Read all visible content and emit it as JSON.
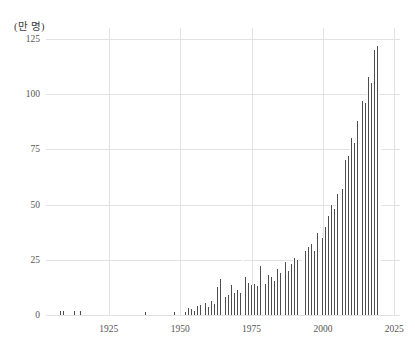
{
  "chart_data": {
    "type": "bar",
    "title": "",
    "subtitle": "",
    "xlabel": "",
    "ylabel": "(만 명)",
    "ylabel_note": "unit: 10,000 persons",
    "xlim": [
      1903,
      2027
    ],
    "ylim": [
      0,
      130
    ],
    "grid": true,
    "legend": null,
    "y_ticks": [
      0,
      25,
      50,
      75,
      100,
      125
    ],
    "x_ticks": [
      1925,
      1950,
      1975,
      2000,
      2025
    ],
    "bar_color": "#4d4d4d",
    "grid_color": "#e2e2e2",
    "tick_color": "#555555",
    "categories": [
      1908,
      1909,
      1913,
      1915,
      1938,
      1948,
      1952,
      1953,
      1954,
      1955,
      1956,
      1957,
      1958,
      1959,
      1960,
      1961,
      1962,
      1963,
      1964,
      1965,
      1966,
      1967,
      1968,
      1969,
      1970,
      1971,
      1972,
      1973,
      1974,
      1975,
      1976,
      1977,
      1978,
      1979,
      1980,
      1981,
      1982,
      1983,
      1984,
      1985,
      1986,
      1987,
      1988,
      1989,
      1990,
      1991,
      1992,
      1993,
      1994,
      1995,
      1996,
      1997,
      1998,
      1999,
      2000,
      2001,
      2002,
      2003,
      2004,
      2005,
      2006,
      2007,
      2008,
      2009,
      2010,
      2011,
      2012,
      2013,
      2014,
      2015,
      2016,
      2017,
      2018,
      2019,
      2020
    ],
    "values": [
      2.0,
      2.0,
      2.0,
      2.0,
      1.5,
      1.5,
      1.5,
      3.0,
      2.5,
      2.0,
      4.0,
      4.5,
      4.5,
      5.5,
      3.5,
      6.5,
      5.0,
      12.5,
      16.5,
      12.0,
      8.0,
      9.0,
      13.5,
      10.0,
      11.5,
      10.0,
      25.0,
      17.0,
      14.5,
      13.5,
      14.0,
      13.0,
      22.0,
      17.5,
      14.0,
      18.0,
      17.0,
      15.5,
      21.0,
      19.0,
      12.5,
      24.0,
      20.0,
      23.0,
      26.0,
      25.0,
      24.5,
      27.0,
      29.0,
      31.0,
      32.0,
      29.0,
      37.0,
      41.0,
      35.0,
      40.0,
      45.0,
      50.0,
      48.0,
      55.0,
      65.0,
      57.0,
      70.0,
      72.0,
      80.0,
      78.0,
      88.0,
      92.0,
      97.0,
      96.0,
      108.0,
      105.0,
      120.0,
      122.0,
      95.0
    ]
  }
}
